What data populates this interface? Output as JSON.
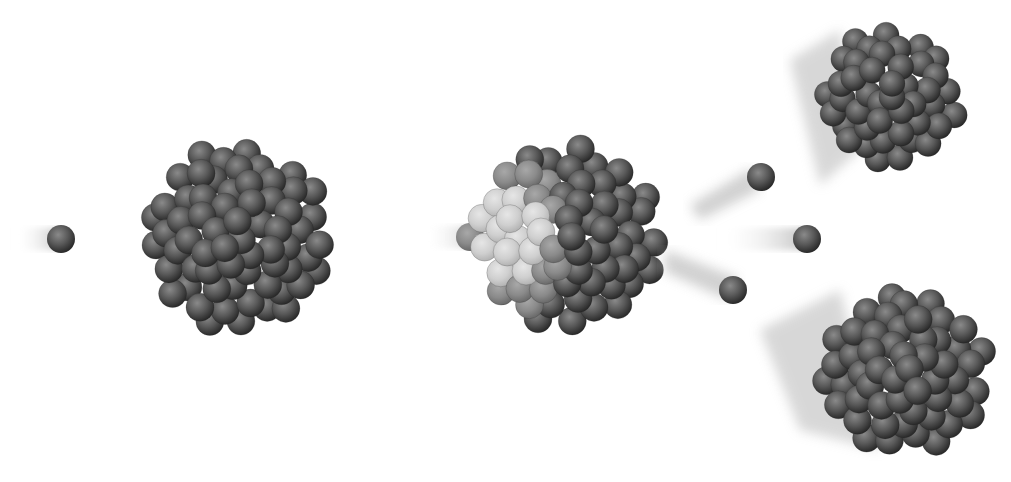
{
  "diagram": {
    "title_clipped": "—— ——————— —— —————— ——————",
    "stages": [
      {
        "label": "incoming-neutron"
      },
      {
        "label": "target-nucleus"
      },
      {
        "label": "neutron-absorbed-nucleus-splitting"
      },
      {
        "label": "released-neutrons",
        "count": 3
      },
      {
        "label": "fission-fragment-upper"
      },
      {
        "label": "fission-fragment-lower"
      }
    ],
    "colors": {
      "background": "#ffffff",
      "sphere_dark": "#2e2e2e",
      "sphere_mid": "#5a5a5a",
      "sphere_light": "#8a8a8a",
      "trail": "#c8c8c8"
    }
  }
}
